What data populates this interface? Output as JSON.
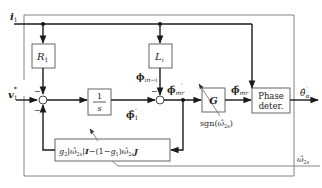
{
  "diagram": {
    "type": "block-diagram",
    "inputs": {
      "current": "i",
      "current_sub": "1",
      "voltage_ref": "v",
      "voltage_ref_sub": "1",
      "voltage_ref_sup": "*"
    },
    "blocks": {
      "r1": {
        "main": "R",
        "sub": "1"
      },
      "li": {
        "main": "L",
        "sub": "i"
      },
      "integrator": {
        "num": "1",
        "den": "s"
      },
      "g": {
        "main": "G"
      },
      "phase": {
        "line1": "Phase",
        "line2": "deter."
      },
      "feedback": {
        "g2": "g",
        "g2_sub": "2",
        "abs_open": "|",
        "omega": "ω̂",
        "omega_sub": "2s",
        "abs_close": "|",
        "I": "I",
        "minus_paren": "−(1−",
        "g1": "g",
        "g1_sub": "1",
        "paren_close": ")",
        "omega2": "ω̂",
        "omega2_sub": "2s",
        "J": "J"
      }
    },
    "signals": {
      "phi_in": {
        "main": "ϕ",
        "sub": "in−i"
      },
      "phi_tilde": {
        "main": "ϕ̃",
        "sub": "1",
        "sup": "′"
      },
      "phi_mr_hat": {
        "main": "ϕ̂",
        "sub": "mr",
        "sup": "′"
      },
      "phi_mr_hat2": {
        "main": "ϕ̂",
        "sub": "mr"
      },
      "theta_out": {
        "main": "θ̂",
        "sub": "α",
        "sup": "′"
      },
      "omega_in": {
        "main": "ω̂",
        "sub": "2s"
      },
      "sgn": {
        "text": "sgn(",
        "omega": "ω̂",
        "sub": "2s",
        "close": ")"
      }
    },
    "signs": {
      "sum1_top": "−",
      "sum1_bottom": "−",
      "sum2_top": "−"
    }
  }
}
